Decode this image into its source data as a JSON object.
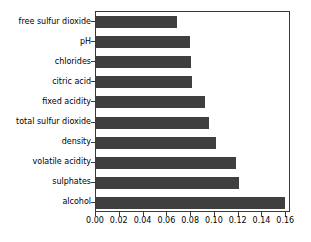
{
  "chart_data": {
    "type": "bar",
    "orientation": "horizontal",
    "title": "",
    "xlabel": "",
    "ylabel": "",
    "categories": [
      "free sulfur dioxide",
      "pH",
      "chlorides",
      "citric acid",
      "fixed acidity",
      "total sulfur dioxide",
      "density",
      "volatile acidity",
      "sulphates",
      "alcohol"
    ],
    "values": [
      0.068,
      0.079,
      0.08,
      0.081,
      0.092,
      0.095,
      0.101,
      0.118,
      0.12,
      0.159
    ],
    "xlim": [
      0.0,
      0.164
    ],
    "xticks": [
      0.0,
      0.02,
      0.04,
      0.06,
      0.08,
      0.1,
      0.12,
      0.14,
      0.16
    ],
    "xtick_labels": [
      "0.00",
      "0.02",
      "0.04",
      "0.06",
      "0.08",
      "0.10",
      "0.12",
      "0.14",
      "0.16"
    ],
    "grid": false,
    "legend": null,
    "bar_color": "#3f3f3f",
    "axis_color": "#3a3a3a",
    "background_color": "#ffffff"
  }
}
